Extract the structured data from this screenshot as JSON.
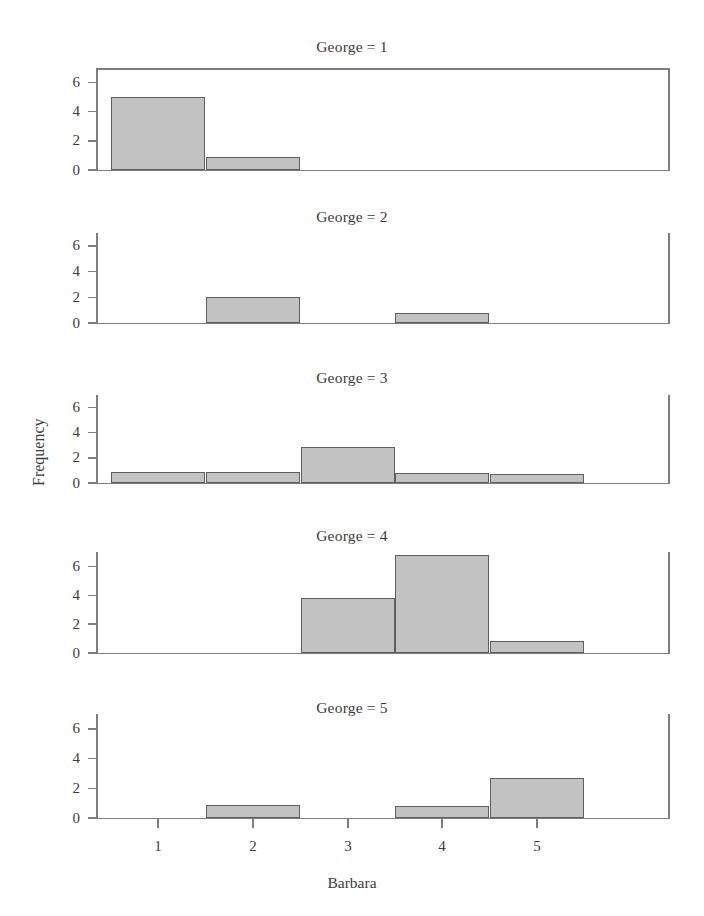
{
  "chart_data": {
    "type": "bar",
    "title": "",
    "xlabel": "Barbara",
    "ylabel": "Frequency",
    "categories": [
      1,
      2,
      3,
      4,
      5
    ],
    "xtick_labels": [
      "1",
      "2",
      "3",
      "4",
      "5"
    ],
    "ytick_labels": [
      "0",
      "2",
      "4",
      "6"
    ],
    "ytick_values": [
      0,
      2,
      4,
      6
    ],
    "ylim": [
      0,
      7
    ],
    "xlim": [
      0.5,
      5.5
    ],
    "grid": false,
    "legend": null,
    "bar_fill_color": "#c2c2c2",
    "bar_edge_color": "#5e5e5e",
    "axis_color": "#7d7d7d",
    "panel_variable": "George",
    "panels": [
      {
        "label": "George = 1",
        "values": [
          5.0,
          0.9,
          0,
          0,
          0
        ]
      },
      {
        "label": "George = 2",
        "values": [
          0,
          2.0,
          0,
          0.8,
          0
        ]
      },
      {
        "label": "George = 3",
        "values": [
          0.9,
          0.85,
          2.9,
          0.8,
          0.75
        ]
      },
      {
        "label": "George = 4",
        "values": [
          0,
          0,
          3.8,
          6.8,
          0.8
        ]
      },
      {
        "label": "George = 5",
        "values": [
          0,
          0.9,
          0,
          0.8,
          2.7
        ]
      }
    ]
  }
}
